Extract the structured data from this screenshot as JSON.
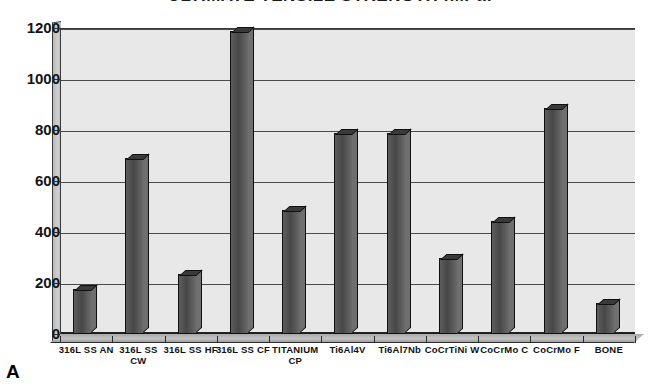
{
  "figure": {
    "panel_letter": "A",
    "title": "ULTIMATE TENSILE STRENGTH (MPa)",
    "background_color": "#ffffff",
    "plot_background_color": "#e8e8e8",
    "bar_color": "#4a4a4a",
    "grid_color": "#4a4a4a"
  },
  "chart_data": {
    "type": "bar",
    "title": "ULTIMATE TENSILE STRENGTH (MPa)",
    "xlabel": "",
    "ylabel": "",
    "ylim": [
      0,
      1200
    ],
    "yticks": [
      0,
      200,
      400,
      600,
      800,
      1000,
      1200
    ],
    "ytick_labels": [
      "0",
      "200",
      "400",
      "600",
      "800",
      "1000",
      "1200"
    ],
    "grid": true,
    "legend": false,
    "categories": [
      "316L SS AN",
      "316L SS CW",
      "316L SS HF",
      "316L SS CF",
      "TITANIUM CP",
      "Ti6Al4V",
      "Ti6Al7Nb",
      "CoCrTiNi W",
      "CoCrMo C",
      "CoCrMo F",
      "BONE"
    ],
    "category_lines": [
      [
        "316L SS AN",
        ""
      ],
      [
        "316L SS",
        "CW"
      ],
      [
        "316L SS HF",
        ""
      ],
      [
        "316L SS CF",
        ""
      ],
      [
        "TITANIUM",
        "CP"
      ],
      [
        "Ti6Al4V",
        ""
      ],
      [
        "Ti6Al7Nb",
        ""
      ],
      [
        "CoCrTiNi W",
        ""
      ],
      [
        "CoCrMo C",
        ""
      ],
      [
        "CoCrMo F",
        ""
      ],
      [
        "BONE",
        ""
      ]
    ],
    "values": [
      175,
      690,
      235,
      1190,
      485,
      790,
      790,
      300,
      445,
      885,
      120
    ],
    "units": "MPa"
  }
}
